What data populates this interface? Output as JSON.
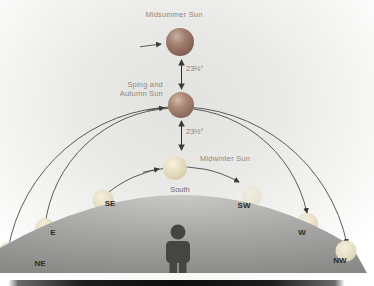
{
  "diagram": {
    "sun_labels": {
      "midsummer": "Midsummer Sun",
      "equinox_line1": "Sping and",
      "equinox_line2": "Autumn Sun",
      "midwinter": "Midwinter Sun"
    },
    "angles": {
      "upper": "23½°",
      "lower": "23½°"
    },
    "direction_labels": {
      "south": "South",
      "southeast": "SE",
      "east": "E",
      "northeast": "NE",
      "southwest": "SW",
      "west": "W",
      "northwest": "NW"
    },
    "colors": {
      "midsummer_sun": "#9c7a69",
      "equinox_sun": "#ad8a75",
      "midwinter_sun": "#e9e1c6",
      "horizon_sun": "#e8e0c6",
      "hill_gray": "#a2a2a0",
      "arc_line": "#4a4a48",
      "label_text": "#8f8881",
      "compass_text": "#2d2d2b",
      "figure_gray": "#454543"
    }
  }
}
